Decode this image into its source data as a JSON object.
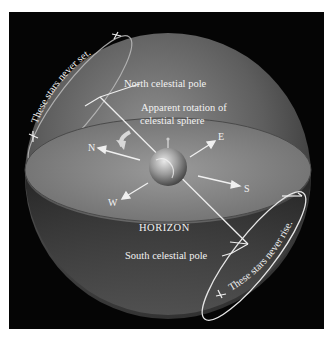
{
  "diagram": {
    "labels": {
      "north_pole": "North celestial pole",
      "south_pole": "South celestial pole",
      "rotation_line1": "Apparent rotation of",
      "rotation_line2": "celestial sphere",
      "horizon": "HORIZON",
      "never_set": "These stars never set.",
      "never_rise": "These stars never rise."
    },
    "directions": {
      "north": "N",
      "east": "E",
      "south": "S",
      "west": "W"
    },
    "colors": {
      "background": "#050505",
      "sphere": "#6a6a6a",
      "horizon_plane": "#8c8c8c",
      "lines": "#eeeeee",
      "frame": "#ffffff"
    }
  }
}
